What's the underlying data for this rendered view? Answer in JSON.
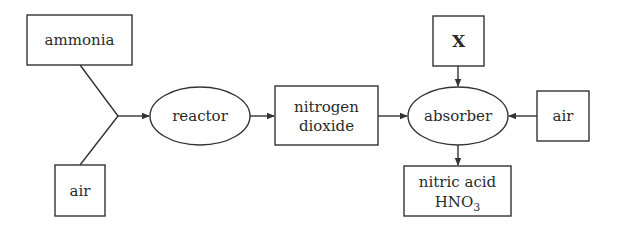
{
  "diagram": {
    "nodes": {
      "ammonia": {
        "label": "ammonia",
        "shape": "rectangle"
      },
      "air_input_left": {
        "label": "air",
        "shape": "rectangle"
      },
      "reactor": {
        "label": "reactor",
        "shape": "ellipse"
      },
      "nitrogen_dioxide": {
        "line1": "nitrogen",
        "line2": "dioxide",
        "shape": "rectangle"
      },
      "x": {
        "label": "X",
        "shape": "rectangle"
      },
      "absorber": {
        "label": "absorber",
        "shape": "ellipse"
      },
      "air_input_right": {
        "label": "air",
        "shape": "rectangle"
      },
      "nitric_acid": {
        "line1": "nitric acid",
        "formula_main": "HNO",
        "formula_sub": "3",
        "shape": "rectangle"
      }
    },
    "edges": [
      {
        "from": "ammonia",
        "to": "junction"
      },
      {
        "from": "air_input_left",
        "to": "junction"
      },
      {
        "from": "junction",
        "to": "reactor"
      },
      {
        "from": "reactor",
        "to": "nitrogen_dioxide"
      },
      {
        "from": "nitrogen_dioxide",
        "to": "absorber"
      },
      {
        "from": "x",
        "to": "absorber"
      },
      {
        "from": "air_input_right",
        "to": "absorber"
      },
      {
        "from": "absorber",
        "to": "nitric_acid"
      }
    ],
    "colors": {
      "stroke": "#333333",
      "text": "#2a2a2a",
      "background": "#ffffff"
    }
  }
}
